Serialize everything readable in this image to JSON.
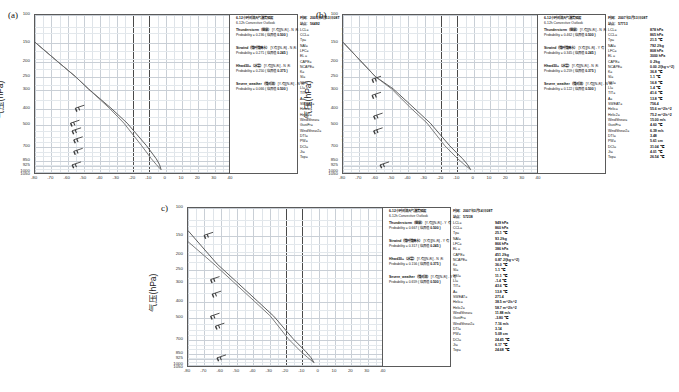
{
  "figure": {
    "type": "sounding-diagram-set",
    "panels": [
      "a",
      "b",
      "c"
    ],
    "y_axis_label": "气压(hPa)",
    "x_axis_label": ""
  },
  "chart_data": {
    "type": "line",
    "xlabel": "",
    "ylabel": "气压(hPa)",
    "xlim": [
      -80,
      40
    ],
    "ylim": [
      1050,
      100
    ],
    "grid": true,
    "legend_position": "none",
    "xticks": [
      -80,
      -70,
      -60,
      -50,
      -40,
      -30,
      -20,
      -10,
      0,
      10,
      20,
      30,
      40,
      50,
      60,
      70,
      80
    ],
    "yticks": [
      100,
      150,
      200,
      250,
      300,
      400,
      500,
      700,
      850,
      925,
      1000,
      1050
    ],
    "major_vertical_lines": [
      -20,
      -10
    ],
    "panels": [
      {
        "label": "(a)",
        "series": [
          {
            "name": "温度(Temperature)",
            "points": [
              [
                -80,
                150
              ],
              [
                -66,
                200
              ],
              [
                -55,
                250
              ],
              [
                -47,
                300
              ],
              [
                -33,
                400
              ],
              [
                -23,
                500
              ],
              [
                -11,
                700
              ],
              [
                -5,
                850
              ],
              [
                -3,
                925
              ],
              [
                -2,
                1000
              ]
            ]
          },
          {
            "name": "露点(Dewpoint)",
            "points": [
              [
                -80,
                150
              ],
              [
                -66,
                200
              ],
              [
                -55,
                250
              ],
              [
                -47,
                300
              ],
              [
                -34,
                400
              ],
              [
                -25,
                500
              ],
              [
                -14,
                700
              ],
              [
                -8,
                850
              ],
              [
                -5,
                925
              ],
              [
                -2,
                1000
              ]
            ]
          }
        ],
        "wind_barbs": [
          [
            -55,
            400
          ],
          [
            -58,
            500
          ],
          [
            -57,
            560
          ],
          [
            -56,
            640
          ],
          [
            -56,
            760
          ],
          [
            -57,
            930
          ]
        ]
      },
      {
        "label": "(b)",
        "series": [
          {
            "name": "温度(Temperature)",
            "points": [
              [
                -80,
                150
              ],
              [
                -60,
                250
              ],
              [
                -49,
                300
              ],
              [
                -36,
                400
              ],
              [
                -26,
                500
              ],
              [
                -14,
                700
              ],
              [
                -6,
                850
              ],
              [
                -3,
                925
              ],
              [
                -1,
                1000
              ]
            ]
          },
          {
            "name": "露点(Dewpoint)",
            "points": [
              [
                -80,
                150
              ],
              [
                -60,
                250
              ],
              [
                -50,
                300
              ],
              [
                -38,
                400
              ],
              [
                -28,
                500
              ],
              [
                -17,
                700
              ],
              [
                -9,
                850
              ],
              [
                -5,
                925
              ],
              [
                -1,
                1000
              ]
            ]
          }
        ],
        "wind_barbs": [
          [
            -62,
            260
          ],
          [
            -62,
            330
          ],
          [
            -61,
            450
          ],
          [
            -61,
            560
          ],
          [
            -57,
            930
          ]
        ]
      },
      {
        "label": "c)",
        "series": [
          {
            "name": "温度(Temperature)",
            "points": [
              [
                -80,
                140
              ],
              [
                -62,
                230
              ],
              [
                -50,
                300
              ],
              [
                -37,
                400
              ],
              [
                -27,
                500
              ],
              [
                -15,
                700
              ],
              [
                -7,
                850
              ],
              [
                -4,
                925
              ],
              [
                -2,
                1000
              ]
            ]
          },
          {
            "name": "露点(Dewpoint)",
            "points": [
              [
                -80,
                165
              ],
              [
                -63,
                235
              ],
              [
                -52,
                300
              ],
              [
                -39,
                400
              ],
              [
                -29,
                500
              ],
              [
                -18,
                700
              ],
              [
                -10,
                850
              ],
              [
                -6,
                925
              ],
              [
                -2,
                1000
              ]
            ]
          }
        ],
        "wind_barbs": [
          [
            -70,
            150
          ],
          [
            -66,
            290
          ],
          [
            -65,
            360
          ],
          [
            -66,
            500
          ],
          [
            -63,
            580
          ],
          [
            -62,
            930
          ]
        ]
      }
    ]
  },
  "outlook": {
    "a": {
      "header_cn": "6-12小时对流天气潜势预报",
      "header_en": "6-12h Convective Outlook",
      "groups": [
        {
          "name": "Thunderstorm（雷暴）",
          "verdict": "[Y-有][N-无] - N 无",
          "probability_label": "Probability =",
          "probability": "0.236",
          "threshold_label": "( 临界值",
          "threshold": "0.500 )"
        },
        {
          "name": "Strwind（强时强降水）",
          "verdict": "[Y-有][N-无] - N 无",
          "probability_label": "Probability =",
          "probability": "0.271",
          "threshold_label": "( 临界值",
          "threshold": "0.245 )"
        },
        {
          "name": "Hhwd30+（冰雹）",
          "verdict": "[Y-有][N-无] - N 无",
          "probability_label": "Probability =",
          "probability": "0.250",
          "threshold_label": "( 临界值",
          "threshold": "0.375 )"
        },
        {
          "name": "Severe_weather（强对流）",
          "verdict": "[Y-有][N-无] - N 无",
          "probability_label": "Probability =",
          "probability": "0.066",
          "threshold_label": "( 临界值",
          "threshold": "0.500 )"
        }
      ]
    },
    "b": {
      "header_cn": "6-12小时对流天气潜势预报",
      "header_en": "6-12h Convective Outlook",
      "groups": [
        {
          "name": "Thunderstorm（雷暴）",
          "verdict": "[Y-有][N-无] - N 无",
          "probability_label": "Probability =",
          "probability": "0.462",
          "threshold_label": "( 临界值",
          "threshold": "0.500 )"
        },
        {
          "name": "Strwind（强时强降水）",
          "verdict": "[Y-有][N-无] - Y 有",
          "probability_label": "Probability =",
          "probability": "0.345",
          "threshold_label": "( 临界值",
          "threshold": "0.245 )"
        },
        {
          "name": "Hhwd30+（冰雹）",
          "verdict": "[Y-有][N-无] - N 无",
          "probability_label": "Probability =",
          "probability": "0.259",
          "threshold_label": "( 临界值",
          "threshold": "0.375 )"
        },
        {
          "name": "Severe_weather（强对流）",
          "verdict": "[Y-有][N-无] - N 无",
          "probability_label": "Probability =",
          "probability": "0.122",
          "threshold_label": "( 临界值",
          "threshold": "0.500 )"
        }
      ]
    },
    "c": {
      "header_cn": "6-12小时对流天气潜势预报",
      "header_en": "6-12h Convective Outlook",
      "groups": [
        {
          "name": "Thunderstorm（雷暴）",
          "verdict": "[Y-有][N-无] - Y 有",
          "probability_label": "Probability =",
          "probability": "0.667",
          "threshold_label": "( 临界值",
          "threshold": "0.500 )"
        },
        {
          "name": "Strwind（强时强降水）",
          "verdict": "[Y-有][N-无] - Y 有",
          "probability_label": "Probability =",
          "probability": "0.317",
          "threshold_label": "( 临界值",
          "threshold": "0.245 )"
        },
        {
          "name": "Hhwd30+（冰雹）",
          "verdict": "[Y-有][N-无] - N 无",
          "probability_label": "Probability =",
          "probability": "0.156",
          "threshold_label": "( 临界值",
          "threshold": "0.375 )"
        },
        {
          "name": "Severe_weather（强对流）",
          "verdict": "[Y-有][N-无] - Y 有",
          "probability_label": "Probability =",
          "probability": "0.659",
          "threshold_label": "( 临界值",
          "threshold": "0.500 )"
        }
      ]
    }
  },
  "params": {
    "a": {
      "time_key": "时间：",
      "time_val": "2007年3月13日 08T",
      "station_key": "站点：",
      "station_val": "56492",
      "rows": [
        {
          "key": "LCL=",
          "val": "968 hPa"
        },
        {
          "key": "CCL=",
          "val": "968 hPa"
        },
        {
          "key": "Tp=",
          "val": "29.1 ℃"
        },
        {
          "key": "NAI=",
          "val": "0 J/kg"
        },
        {
          "key": "LFC=",
          "val": "968 hPa"
        },
        {
          "key": "EL =",
          "val": "845 hPa"
        },
        {
          "key": "CAPE=",
          "val": "7 J/kg"
        },
        {
          "key": "NCAPE=",
          "val": "0.05 J/(kg·s^2)"
        },
        {
          "key": "K=",
          "val": "23.8 ℃"
        },
        {
          "key": "SI=",
          "val": "4.1 ℃"
        },
        {
          "key": "SSI=",
          "val": "21.6 ℃"
        },
        {
          "key": "LI=",
          "val": "3.6 ℃"
        },
        {
          "key": "TIT=",
          "val": "36.8 ℃"
        },
        {
          "key": "A=",
          "val": "18.6 ℃"
        },
        {
          "key": "SWEAT=",
          "val": "734.6"
        },
        {
          "key": "Helic=",
          "val": "19.5 m^2/s^2"
        },
        {
          "key": "Helic2=",
          "val": "-2.2 m^2/s^2"
        },
        {
          "key": "WindShear=",
          "val": "12.17 m/s"
        },
        {
          "key": "GustFr=",
          "val": "18.66 ℃"
        },
        {
          "key": "WindShear2=",
          "val": "3.54 m/s"
        },
        {
          "key": "DTI=",
          "val": "4.00"
        },
        {
          "key": "PW=",
          "val": "5.59 cm"
        },
        {
          "key": "DCI=",
          "val": "26.95 ℃"
        },
        {
          "key": "Jt=",
          "val": "6.43 ℃"
        },
        {
          "key": "Top=",
          "val": "28.34 ℃"
        }
      ]
    },
    "b": {
      "time_key": "时间：",
      "time_val": "2007年3月13日 08T",
      "station_key": "站点：",
      "station_val": "57713",
      "rows": [
        {
          "key": "LCL=",
          "val": "878 hPa"
        },
        {
          "key": "CCL=",
          "val": "865 hPa"
        },
        {
          "key": "Tp=",
          "val": "21.5 ℃"
        },
        {
          "key": "NAI=",
          "val": "792 J/kg"
        },
        {
          "key": "LFC=",
          "val": "808 hPa"
        },
        {
          "key": "EL =",
          "val": "3000 hPa"
        },
        {
          "key": "CAPE=",
          "val": "0 J/kg"
        },
        {
          "key": "NCAPE=",
          "val": "0.00 J/(kg·s^2)"
        },
        {
          "key": "K=",
          "val": "36.8 ℃"
        },
        {
          "key": "SI=",
          "val": "1.1 ℃"
        },
        {
          "key": "SSI=",
          "val": "16.8 ℃"
        },
        {
          "key": "LI=",
          "val": "1.4 ℃"
        },
        {
          "key": "TIT=",
          "val": "41.6 ℃"
        },
        {
          "key": "A=",
          "val": "13.8 ℃"
        },
        {
          "key": "SWEAT=",
          "val": "756.4"
        },
        {
          "key": "Helic=",
          "val": "55.6 m^2/s^2"
        },
        {
          "key": "Helic2=",
          "val": "75.2 m^2/s^2"
        },
        {
          "key": "WindShear=",
          "val": "15.00 m/s"
        },
        {
          "key": "GustFr=",
          "val": "4.60 ℃"
        },
        {
          "key": "WindShear2=",
          "val": "6.39 m/s"
        },
        {
          "key": "DTI=",
          "val": "3.48"
        },
        {
          "key": "PW=",
          "val": "5.61 cm"
        },
        {
          "key": "DCI=",
          "val": "31.04 ℃"
        },
        {
          "key": "Jt=",
          "val": "4.01 ℃"
        },
        {
          "key": "Top=",
          "val": "26.54 ℃"
        }
      ]
    },
    "c": {
      "time_key": "时间：",
      "time_val": "2007年3月14日 08T",
      "station_key": "站点：",
      "station_val": "57238",
      "rows": [
        {
          "key": "LCL=",
          "val": "949 hPa"
        },
        {
          "key": "CCL=",
          "val": "860 hPa"
        },
        {
          "key": "Tp=",
          "val": "25.1 ℃"
        },
        {
          "key": "NAI=",
          "val": "93 J/kg"
        },
        {
          "key": "LFC=",
          "val": "866 hPa"
        },
        {
          "key": "EL =",
          "val": "386 hPa"
        },
        {
          "key": "CAPE=",
          "val": "451 J/kg"
        },
        {
          "key": "NCAPE=",
          "val": "0.87 J/(kg·s^2)"
        },
        {
          "key": "K=",
          "val": "36.0 ℃"
        },
        {
          "key": "SI=",
          "val": "1.1 ℃"
        },
        {
          "key": "SSI=",
          "val": "11.1 ℃"
        },
        {
          "key": "LI=",
          "val": "-1.4 ℃"
        },
        {
          "key": "TIT=",
          "val": "43.6 ℃"
        },
        {
          "key": "A=",
          "val": "13.8 ℃"
        },
        {
          "key": "SWEAT=",
          "val": "271.4"
        },
        {
          "key": "Helic=",
          "val": "38.5 m^2/s^2"
        },
        {
          "key": "Helic2=",
          "val": "58.7 m^2/s^2"
        },
        {
          "key": "WindShear=",
          "val": "11.88 m/s"
        },
        {
          "key": "GustFr=",
          "val": "-3.80 ℃"
        },
        {
          "key": "WindShear2=",
          "val": "7.16 m/s"
        },
        {
          "key": "DTI=",
          "val": "3.14"
        },
        {
          "key": "PW=",
          "val": "5.09 cm"
        },
        {
          "key": "DCI=",
          "val": "24.45 ℃"
        },
        {
          "key": "Jt=",
          "val": "6.17 ℃"
        },
        {
          "key": "Top=",
          "val": "24.68 ℃"
        }
      ]
    }
  }
}
